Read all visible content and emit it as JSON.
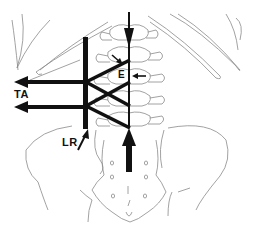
{
  "diagram": {
    "type": "anatomical-force-diagram",
    "view": "posterior lumbar spine, rib cage and pelvis",
    "labels": {
      "ta": "TA",
      "e": "E",
      "lr": "LR"
    },
    "colors": {
      "outline": "#8a8a8a",
      "force": "#111111",
      "background": "#ffffff"
    },
    "force_vectors": [
      {
        "id": "ta-upper",
        "direction": "left",
        "label": "TA"
      },
      {
        "id": "ta-lower",
        "direction": "left",
        "label": "TA"
      },
      {
        "id": "spine-compression-down",
        "direction": "down"
      },
      {
        "id": "spine-compression-up",
        "direction": "up"
      },
      {
        "id": "e-arrow",
        "direction": "left",
        "label": "E"
      },
      {
        "id": "lr-arrow",
        "direction": "up-right",
        "label": "LR"
      }
    ]
  }
}
